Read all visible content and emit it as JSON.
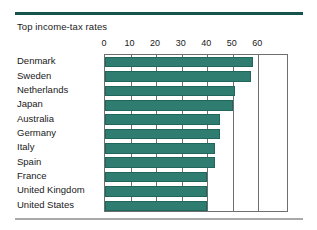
{
  "chart_data": {
    "type": "bar",
    "orientation": "horizontal",
    "title": "Top income-tax rates",
    "xlabel": "",
    "ylabel": "",
    "xlim": [
      0,
      72
    ],
    "xticks": [
      0,
      10,
      20,
      30,
      40,
      50,
      60
    ],
    "xtick_labels": [
      "0",
      "10",
      "20",
      "30",
      "40",
      "50",
      "60"
    ],
    "grid": true,
    "legend": false,
    "categories": [
      "Denmark",
      "Sweden",
      "Netherlands",
      "Japan",
      "Australia",
      "Germany",
      "Italy",
      "Spain",
      "France",
      "United Kingdom",
      "United States"
    ],
    "values": [
      58,
      57,
      51,
      50,
      45,
      45,
      43,
      43,
      40,
      40,
      40
    ],
    "bar_color": "#2e7d70",
    "rule_color_top": "#15544c",
    "rule_color_bottom": "#a9a9a9",
    "axis_color": "#6f6f6f"
  }
}
